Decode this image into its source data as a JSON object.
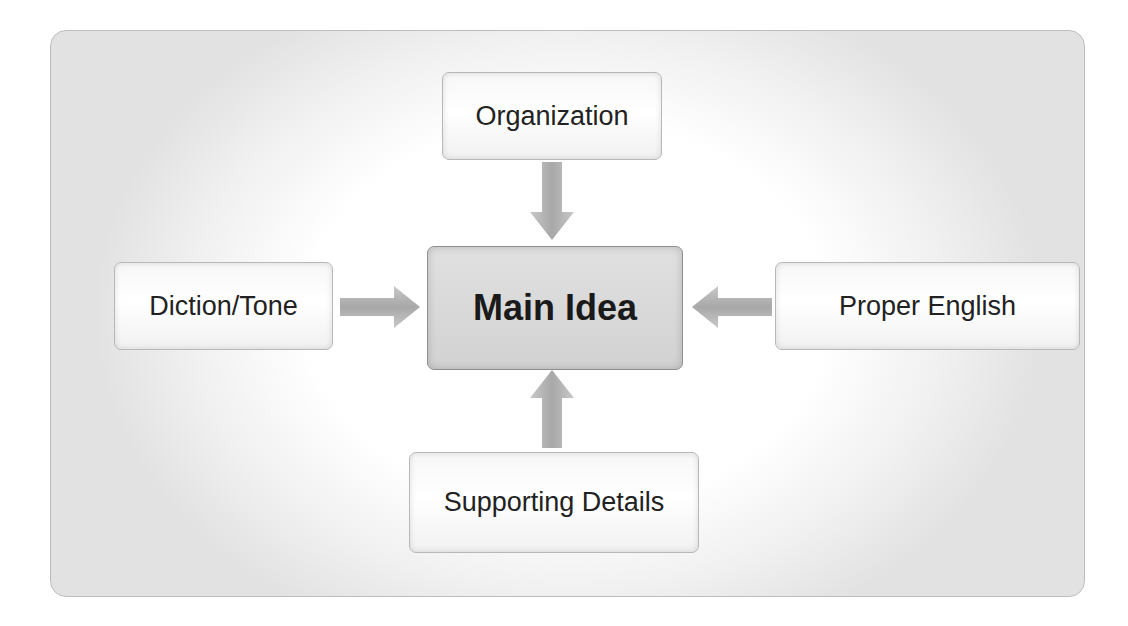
{
  "diagram": {
    "center": {
      "label": "Main Idea"
    },
    "nodes": {
      "top": {
        "label": "Organization"
      },
      "left": {
        "label": "Diction/Tone"
      },
      "right": {
        "label": "Proper English"
      },
      "bottom": {
        "label": "Supporting Details"
      }
    },
    "arrows": [
      {
        "from": "Organization",
        "to": "Main Idea",
        "direction": "down"
      },
      {
        "from": "Diction/Tone",
        "to": "Main Idea",
        "direction": "right"
      },
      {
        "from": "Proper English",
        "to": "Main Idea",
        "direction": "left"
      },
      {
        "from": "Supporting Details",
        "to": "Main Idea",
        "direction": "up"
      }
    ],
    "colors": {
      "box_fill": "#f4f4f4",
      "center_fill": "#d8d8d8",
      "arrow": "#b5b5b5",
      "border": "#b8b8b8"
    }
  }
}
